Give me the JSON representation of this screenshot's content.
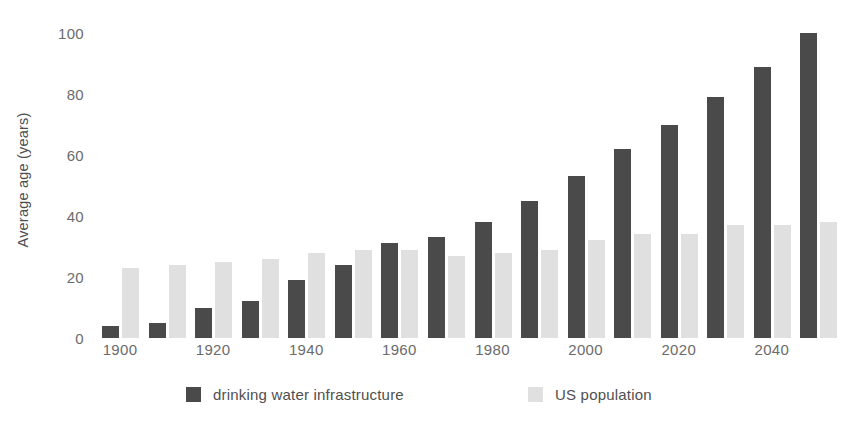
{
  "chart_data": {
    "type": "bar",
    "title": "",
    "subtitle": "",
    "xlabel": "",
    "ylabel": "Average age (years)",
    "categories": [
      1900,
      1910,
      1920,
      1930,
      1940,
      1950,
      1960,
      1970,
      1980,
      1990,
      2000,
      2010,
      2020,
      2030,
      2040,
      2050
    ],
    "x_tick_labels": [
      "1900",
      "1920",
      "1940",
      "1960",
      "1980",
      "2000",
      "2020",
      "2040"
    ],
    "x_tick_values": [
      1900,
      1920,
      1940,
      1960,
      1980,
      2000,
      2020,
      2040
    ],
    "y_tick_labels": [
      "0",
      "20",
      "40",
      "60",
      "80",
      "100"
    ],
    "y_tick_values": [
      0,
      20,
      40,
      60,
      80,
      100
    ],
    "ylim": [
      0,
      100
    ],
    "grid": false,
    "legend_position": "bottom",
    "series": [
      {
        "name": "drinking water infrastructure",
        "color": "#4a4a4a",
        "values": [
          4,
          5,
          10,
          12,
          19,
          24,
          31,
          33,
          38,
          45,
          53,
          62,
          70,
          79,
          89,
          100
        ]
      },
      {
        "name": "US population",
        "color": "#e0e0e0",
        "values": [
          23,
          24,
          25,
          26,
          28,
          29,
          29,
          27,
          28,
          29,
          32,
          34,
          34,
          37,
          37,
          38
        ]
      }
    ]
  },
  "colors": {
    "background": "#ffffff",
    "dark_series": "#4a4a4a",
    "light_series": "#e0e0e0",
    "tick_text": "#6b6b6b",
    "axis_title_text": "#4f4f4f"
  }
}
